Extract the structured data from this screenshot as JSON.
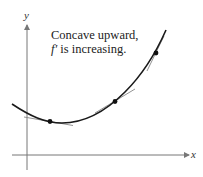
{
  "diagram": {
    "axes": {
      "x_label": "x",
      "y_label": "y"
    },
    "caption": {
      "line1": "Concave upward,",
      "line2_func": "f′",
      "line2_rest": " is increasing."
    },
    "colors": {
      "curve": "#1a1a1a",
      "axis": "#777777",
      "tangent": "#888888",
      "point": "#111111"
    },
    "points": [
      {
        "name": "left-point",
        "x": 50,
        "y": 121
      },
      {
        "name": "middle-point",
        "x": 115,
        "y": 101
      },
      {
        "name": "right-point",
        "x": 156,
        "y": 53
      }
    ]
  }
}
